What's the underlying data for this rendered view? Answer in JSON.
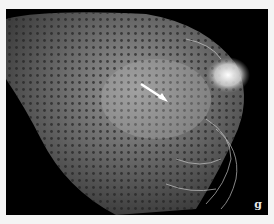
{
  "figure": {
    "panel_label": "g",
    "colors": {
      "background": "#000000",
      "border": "#f4f4f4",
      "label": "#e8e8e8"
    }
  }
}
